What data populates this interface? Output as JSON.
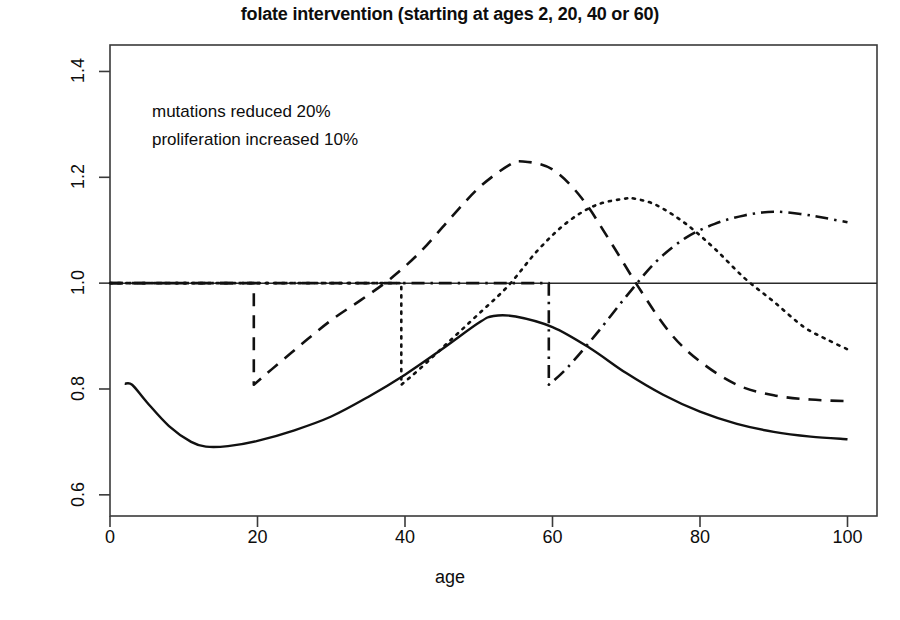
{
  "chart_data": {
    "type": "line",
    "title": "folate intervention (starting at ages 2, 20, 40 or 60)",
    "xlabel": "age",
    "ylabel": "relative risk",
    "xlim": [
      0,
      104
    ],
    "ylim": [
      0.56,
      1.45
    ],
    "xticks": [
      "0",
      "20",
      "40",
      "60",
      "80",
      "100"
    ],
    "xtick_values": [
      0,
      20,
      40,
      60,
      80,
      100
    ],
    "yticks": [
      "0.6",
      "0.8",
      "1.0",
      "1.2",
      "1.4"
    ],
    "ytick_values": [
      0.6,
      0.8,
      1.0,
      1.2,
      1.4
    ],
    "grid": false,
    "legend": "none",
    "annotations": [
      "mutations reduced 20%",
      "proliferation increased 10%"
    ],
    "reference_line": {
      "name": "relative risk = 1.0",
      "y": 1.0,
      "style": "solid"
    },
    "series": [
      {
        "name": "intervention starting at age 2",
        "style": "solid",
        "color": "#111111",
        "x": [
          2,
          3,
          5,
          8,
          11,
          13,
          16,
          20,
          25,
          30,
          35,
          40,
          45,
          50,
          52,
          55,
          60,
          65,
          70,
          75,
          80,
          85,
          90,
          95,
          100
        ],
        "y": [
          0.81,
          0.808,
          0.775,
          0.73,
          0.7,
          0.691,
          0.692,
          0.702,
          0.722,
          0.748,
          0.785,
          0.827,
          0.875,
          0.925,
          0.938,
          0.937,
          0.917,
          0.878,
          0.83,
          0.789,
          0.757,
          0.734,
          0.719,
          0.71,
          0.705
        ]
      },
      {
        "name": "intervention starting at age 20",
        "style": "dashed",
        "color": "#111111",
        "x": [
          0,
          5,
          10,
          15,
          19.5,
          19.5,
          22,
          26,
          30,
          34,
          38,
          42,
          46,
          50,
          54,
          56,
          60,
          64,
          68,
          72,
          76,
          80,
          85,
          90,
          95,
          100
        ],
        "y": [
          1.0,
          1.0,
          1.0,
          1.0,
          1.0,
          0.808,
          0.838,
          0.885,
          0.93,
          0.968,
          1.008,
          1.058,
          1.12,
          1.18,
          1.222,
          1.23,
          1.215,
          1.16,
          1.075,
          0.985,
          0.905,
          0.852,
          0.808,
          0.788,
          0.78,
          0.777
        ]
      },
      {
        "name": "intervention starting at age 40",
        "style": "dotted",
        "color": "#111111",
        "x": [
          0,
          10,
          20,
          30,
          39.5,
          39.5,
          42,
          46,
          50,
          54,
          58,
          62,
          66,
          70,
          71,
          74,
          78,
          82,
          86,
          90,
          94,
          97,
          100
        ],
        "y": [
          1.0,
          1.0,
          1.0,
          1.0,
          1.0,
          0.808,
          0.838,
          0.89,
          0.942,
          0.995,
          1.062,
          1.115,
          1.148,
          1.16,
          1.16,
          1.148,
          1.113,
          1.065,
          1.01,
          0.965,
          0.918,
          0.895,
          0.875
        ]
      },
      {
        "name": "intervention starting at age 60",
        "style": "dashdot",
        "color": "#111111",
        "x": [
          0,
          15,
          30,
          45,
          59.5,
          59.5,
          62,
          66,
          70,
          74,
          78,
          82,
          86,
          90,
          94,
          97,
          100
        ],
        "y": [
          1.0,
          1.0,
          1.0,
          1.0,
          1.0,
          0.808,
          0.84,
          0.905,
          0.975,
          1.04,
          1.085,
          1.112,
          1.128,
          1.135,
          1.13,
          1.123,
          1.115
        ]
      }
    ]
  },
  "plot_geometry": {
    "left": 110,
    "right": 877,
    "top": 45,
    "bottom": 516
  }
}
